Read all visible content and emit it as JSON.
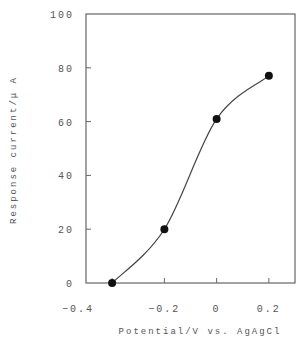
{
  "chart_data": {
    "type": "line",
    "title": "",
    "xlabel": "Potential/V vs. AgAgCl",
    "ylabel": "Response current/μ A",
    "x": [
      -0.4,
      -0.2,
      0.0,
      0.2
    ],
    "series": [
      {
        "name": "Response current",
        "values": [
          0,
          20,
          61,
          77
        ],
        "markers": true,
        "smooth": true
      }
    ],
    "xlim": [
      -0.5,
      0.3
    ],
    "ylim": [
      0,
      100
    ],
    "xticks": [
      -0.4,
      -0.2,
      0,
      0.2
    ],
    "xtick_labels": [
      "−0.4",
      "−0.2",
      "0",
      "0.2"
    ],
    "yticks": [
      0,
      20,
      40,
      60,
      80,
      100
    ],
    "ytick_labels": [
      "0",
      "20",
      "40",
      "60",
      "80",
      "100"
    ],
    "grid": false,
    "legend": null,
    "colors": {
      "line": "#444444",
      "marker": "#111111",
      "axis": "#666666"
    }
  }
}
